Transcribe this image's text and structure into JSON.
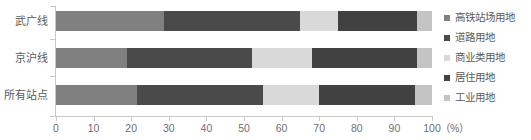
{
  "chart_data": {
    "type": "bar",
    "orientation": "horizontal",
    "stacked": true,
    "normalized": true,
    "title": "",
    "xlabel": "(%)",
    "ylabel": "",
    "xlim": [
      0,
      100
    ],
    "xticks": [
      0,
      10,
      20,
      30,
      40,
      50,
      60,
      70,
      80,
      90,
      100
    ],
    "xtick_labels": [
      "0",
      "10",
      "20",
      "30",
      "40",
      "50",
      "60",
      "70",
      "80",
      "90",
      "100"
    ],
    "x_unit_label": "（%）",
    "grid": false,
    "legend_position": "right",
    "categories": [
      "武广线",
      "京沪线",
      "所有站点"
    ],
    "series": [
      {
        "name": "高铁站场用地",
        "color": "#808080",
        "values": [
          28.7,
          19.0,
          21.5
        ]
      },
      {
        "name": "道路用地",
        "color": "#4a4a4a",
        "values": [
          36.3,
          33.0,
          33.5
        ]
      },
      {
        "name": "商业类用地",
        "color": "#d9d9d9",
        "values": [
          10.0,
          16.0,
          15.0
        ]
      },
      {
        "name": "居住用地",
        "color": "#414141",
        "values": [
          21.0,
          28.0,
          25.5
        ]
      },
      {
        "name": "工业用地",
        "color": "#c4c4c4",
        "values": [
          4.0,
          4.0,
          4.5
        ]
      }
    ]
  },
  "legend": {
    "items": [
      {
        "label": "高铁站场用地",
        "color": "#808080"
      },
      {
        "label": "道路用地",
        "color": "#4a4a4a"
      },
      {
        "label": "商业类用地",
        "color": "#d9d9d9"
      },
      {
        "label": "居住用地",
        "color": "#414141"
      },
      {
        "label": "工业用地",
        "color": "#c4c4c4"
      }
    ]
  },
  "axis": {
    "tick_color": "#c8c8c8",
    "label_color": "#6f6f6f"
  }
}
